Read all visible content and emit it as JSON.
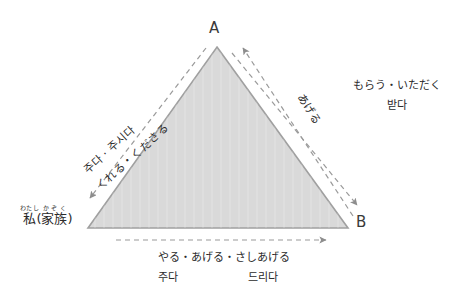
{
  "diagram": {
    "title_vertices": {
      "apex": "A",
      "right": "B"
    },
    "self_label": {
      "kanji_1": "私",
      "ruby_1": "わたし",
      "paren_open": "(",
      "kanji_2": "家族",
      "ruby_2": "かぞく",
      "paren_close": ")"
    },
    "left_edge": {
      "korean": "주다 · 주시다",
      "japanese": "くれる・くださる"
    },
    "right_edge": {
      "japanese": "あげる"
    },
    "right_block": {
      "japanese": "もらう・いただく",
      "korean": "받다"
    },
    "bottom": {
      "japanese": "やる・あげる・さしあげる",
      "korean_1": "주다",
      "korean_2": "드리다"
    },
    "colors": {
      "triangle_fill": "#d9d9d9",
      "triangle_stroke": "#a0a0a0",
      "dash_stroke": "#9a9a9a",
      "text": "#2b2b2b"
    }
  }
}
